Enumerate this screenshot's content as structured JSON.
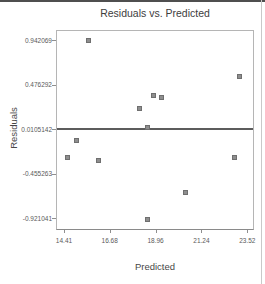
{
  "colors": {
    "title_text": "#3d3d3d",
    "axis_label_text": "#474747",
    "tick_text": "#5a5a5a",
    "plot_border": "#b5b5b5",
    "axis_line": "#8a8a8a",
    "tick_mark": "#8f8f8f",
    "ref_line": "#5c5c5c",
    "marker_fill": "#8e8e8e",
    "marker_border": "#6f6f6f",
    "frame_top": "#4f4f4f",
    "frame_right": "#c9c9c9"
  },
  "chart_data": {
    "type": "scatter",
    "title": "Residuals vs. Predicted",
    "xlabel": "Predicted",
    "ylabel": "Residuals",
    "x_tick_labels": [
      "14.41",
      "16.68",
      "18.96",
      "21.24",
      "23.52"
    ],
    "y_tick_labels": [
      "0.942069",
      "0.476292",
      "0.0105142",
      "-0.455263",
      "-0.921041"
    ],
    "xlim": [
      14.01,
      23.8
    ],
    "ylim": [
      -1.03,
      1.05
    ],
    "grid": false,
    "legend": null,
    "reference_line_y": 0.0105142,
    "marker": {
      "shape": "square",
      "size": 5
    },
    "points": [
      [
        15.65,
        0.94
      ],
      [
        23.11,
        0.56
      ],
      [
        18.88,
        0.36
      ],
      [
        19.28,
        0.34
      ],
      [
        18.14,
        0.23
      ],
      [
        18.58,
        0.03
      ],
      [
        15.01,
        -0.11
      ],
      [
        14.56,
        -0.29
      ],
      [
        16.1,
        -0.32
      ],
      [
        22.86,
        -0.29
      ],
      [
        20.47,
        -0.65
      ],
      [
        18.54,
        -0.93
      ]
    ]
  }
}
